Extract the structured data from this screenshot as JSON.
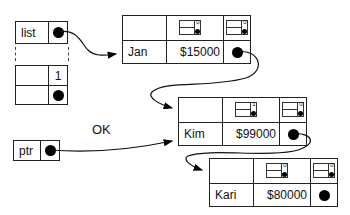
{
  "diagram": {
    "type": "linked-list-memory",
    "list_var": {
      "label": "list",
      "pointer": "dot"
    },
    "list_array": {
      "index_label": "1"
    },
    "ptr_var": {
      "label": "ptr",
      "pointer": "dot"
    },
    "annotation": "OK",
    "nodes": [
      {
        "name": "Jan",
        "salary": "$15000",
        "mini_counts": [
          "0",
          "0"
        ]
      },
      {
        "name": "Kim",
        "salary": "$99000",
        "mini_counts": [
          "1",
          "0"
        ]
      },
      {
        "name": "Kari",
        "salary": "$80000",
        "mini_counts": [
          "0",
          "0"
        ]
      }
    ],
    "edges": [
      {
        "from": "list",
        "to": "Jan"
      },
      {
        "from": "Jan",
        "to": "Kim"
      },
      {
        "from": "ptr",
        "to": "Kim"
      },
      {
        "from": "Kim",
        "to": "Kari"
      }
    ]
  }
}
